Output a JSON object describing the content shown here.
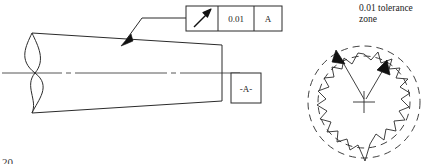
{
  "drawing": {
    "title": "Circular runout tolerance on a tapered shaft",
    "line_color": "#2b2b2b",
    "fill_color": "#ffffff"
  },
  "feature_control_frame": {
    "name": "feature-control-frame",
    "symbol_name": "circular-runout-arrow-icon",
    "symbol_label": "circular runout",
    "tolerance_value": "0.01",
    "datum_reference": "A",
    "box": {
      "x": 186,
      "y": 6,
      "width": 96,
      "height": 25
    },
    "cells": [
      {
        "label": "circular runout",
        "type": "symbol"
      },
      {
        "label": "0.01",
        "type": "text"
      },
      {
        "label": "A",
        "type": "text"
      }
    ]
  },
  "datum_feature_symbol": {
    "name": "datum-feature-symbol",
    "label": "-A-",
    "box": {
      "x": 231,
      "y": 73,
      "width": 30,
      "height": 30
    }
  },
  "leader": {
    "name": "leader-line",
    "points": "186,18 142,18 125,41",
    "arrow_tip": {
      "x": 121,
      "y": 46
    }
  },
  "shaft": {
    "name": "tapered-shaft-outline",
    "top_edge": {
      "x1": 32,
      "y1": 33,
      "x2": 222,
      "y2": 45
    },
    "bottom_edge": {
      "x1": 32,
      "y1": 113,
      "x2": 222,
      "y2": 101
    },
    "right_edge": {
      "x": 222,
      "y1": 45,
      "y2": 101
    },
    "break_line": "S-curve conventional break",
    "centerline": {
      "x1": 2,
      "y": 73,
      "x2": 268
    }
  },
  "tolerance_zone": {
    "name": "tolerance-zone-illustration",
    "label_line1": "0.01 tolerance",
    "label_line2": "zone",
    "center": {
      "x": 364,
      "y": 102
    },
    "outer_radius": 56,
    "inner_radius": 46,
    "dashed": true,
    "arrows": [
      {
        "tip_x": 337,
        "tip_y": 52
      },
      {
        "tip_x": 385,
        "tip_y": 62
      }
    ],
    "profile": "irregular jagged measured surface"
  },
  "corner_mark": {
    "name": "page-corner-mark",
    "text": "20"
  }
}
